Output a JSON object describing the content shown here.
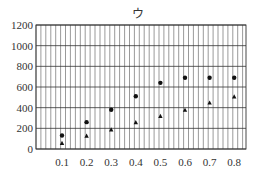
{
  "chart_data": {
    "type": "scatter",
    "title": "ウ",
    "xlabel": "",
    "ylabel": "",
    "x": [
      0.1,
      0.2,
      0.3,
      0.4,
      0.5,
      0.6,
      0.7,
      0.8
    ],
    "xticks": [
      "0.1",
      "0.2",
      "0.3",
      "0.4",
      "0.5",
      "0.6",
      "0.7",
      "0.8"
    ],
    "yticks": [
      "0",
      "200",
      "400",
      "600",
      "800",
      "1000",
      "1200"
    ],
    "ylim": [
      0,
      1200
    ],
    "xlim": [
      0,
      0.85
    ],
    "grid": true,
    "legend": null,
    "series": [
      {
        "name": "circle",
        "marker": "circle",
        "values": [
          130,
          260,
          380,
          510,
          640,
          690,
          690,
          690
        ]
      },
      {
        "name": "triangle",
        "marker": "triangle",
        "values": [
          60,
          130,
          190,
          260,
          320,
          380,
          450,
          510
        ]
      }
    ]
  }
}
